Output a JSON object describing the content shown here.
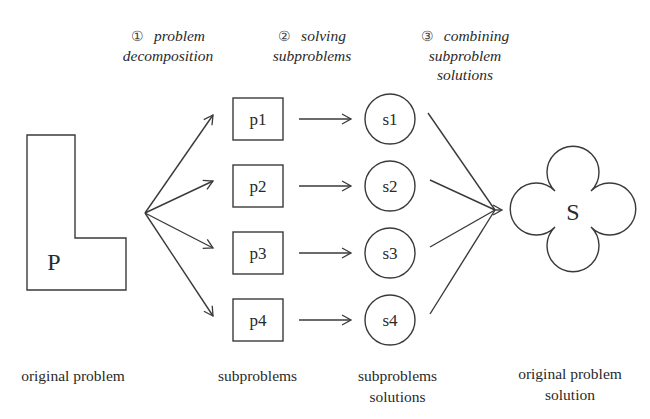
{
  "steps": [
    {
      "num": "①",
      "line1": "problem",
      "line2": "decomposition",
      "line3": ""
    },
    {
      "num": "②",
      "line1": "solving",
      "line2": "subproblems",
      "line3": ""
    },
    {
      "num": "③",
      "line1": "combining",
      "line2": "subproblem",
      "line3": "solutions"
    }
  ],
  "shapes": {
    "original_problem": "P",
    "subproblems": [
      "p1",
      "p2",
      "p3",
      "p4"
    ],
    "subsolutions": [
      "s1",
      "s2",
      "s3",
      "s4"
    ],
    "solution": "S"
  },
  "captions": {
    "original_problem": "original problem",
    "subproblems": "subproblems",
    "subsolutions_line1": "subproblems",
    "subsolutions_line2": "solutions",
    "solution_line1": "original problem",
    "solution_line2": "solution"
  },
  "colors": {
    "stroke": "#3a3a3a",
    "background": "#ffffff"
  }
}
